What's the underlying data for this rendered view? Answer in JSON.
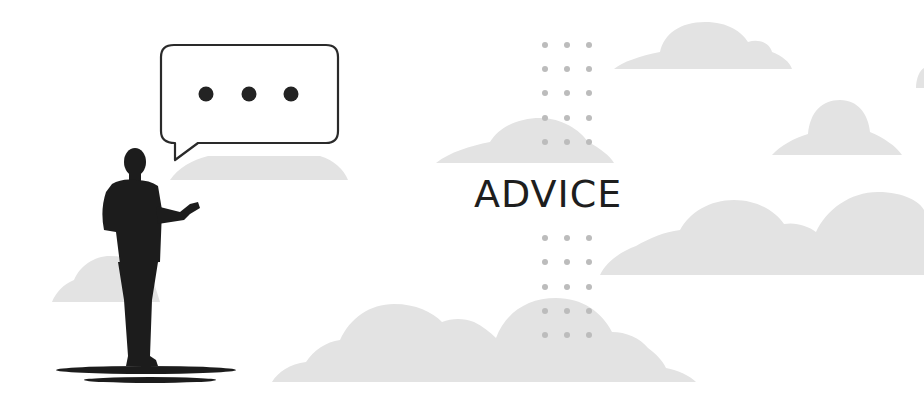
{
  "illustration": {
    "title": "ADVICE",
    "colors": {
      "background": "#ffffff",
      "cloud": "#e2e2e2",
      "dot": "#bdbdbd",
      "silhouette": "#1c1c1c",
      "bubble_stroke": "#2a2a2a",
      "title_text": "#1e1e1e"
    },
    "icons": [
      "speech-bubble-icon",
      "ellipsis-icon",
      "person-silhouette-icon",
      "cloud-icon",
      "dot-grid"
    ]
  }
}
